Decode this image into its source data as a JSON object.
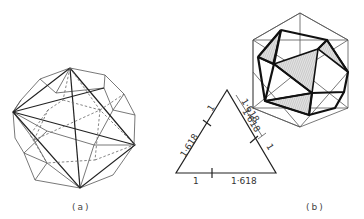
{
  "figure": {
    "panel_a": {
      "caption": "(a)",
      "subject": "rhombic dodecahedron-like polyhedron with inscribed tetrahedron edges (hidden edges dashed)"
    },
    "panel_b": {
      "caption": "(b)",
      "subject": "icosahedron with shaded inscribed triangular faces",
      "golden_triangle": {
        "left_side_labels": [
          "1",
          "1·618"
        ],
        "right_side_labels": [
          "1·618",
          "1"
        ],
        "base_labels": [
          "1",
          "1·618"
        ]
      },
      "diagonal_label": "1·618"
    }
  }
}
